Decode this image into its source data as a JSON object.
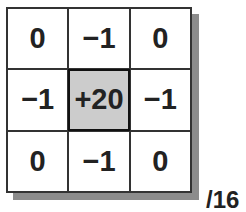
{
  "kernel": {
    "cells": [
      "0",
      "−1",
      "0",
      "−1",
      "+20",
      "−1",
      "0",
      "−1",
      "0"
    ],
    "center_index": 4,
    "divisor": "/16",
    "colors": {
      "center_fill": "#cccccc",
      "shadow": "#8c8c8c",
      "border": "#333333"
    }
  }
}
